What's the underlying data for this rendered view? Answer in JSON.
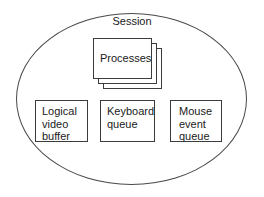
{
  "diagram": {
    "title": "Session",
    "container": {
      "shape": "ellipse",
      "label": "Session",
      "stroke_color": "#4a4a4a"
    },
    "process_stack": {
      "label": "Processes",
      "layers": 3,
      "stroke_color": "#3c3c3c"
    },
    "resources": [
      {
        "id": "logical-video-buffer",
        "label": "Logical\nvideo\nbuffer"
      },
      {
        "id": "keyboard-queue",
        "label": "Keyboard\nqueue"
      },
      {
        "id": "mouse-event-queue",
        "label": "Mouse\nevent\nqueue"
      }
    ]
  }
}
